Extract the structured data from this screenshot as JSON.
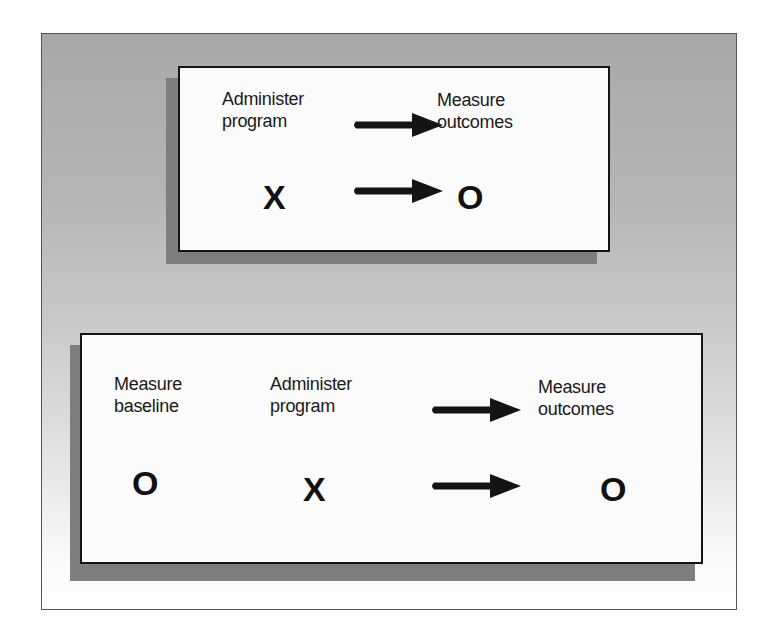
{
  "diagram": {
    "type": "research-design-notation",
    "legend": {
      "X": "Administer program",
      "O": "Measure (observation)"
    },
    "top_design": {
      "labels": {
        "administer": "Administer\nprogram",
        "measure_outcomes": "Measure\noutcomes"
      },
      "symbols": {
        "treatment": "X",
        "outcome": "O"
      },
      "arrows": [
        "label-arrow",
        "symbol-arrow"
      ]
    },
    "bottom_design": {
      "labels": {
        "measure_baseline": "Measure\nbaseline",
        "administer": "Administer\nprogram",
        "measure_outcomes": "Measure\noutcomes"
      },
      "symbols": {
        "baseline": "O",
        "treatment": "X",
        "outcome": "O"
      },
      "arrows": [
        "label-arrow",
        "symbol-arrow"
      ]
    },
    "colors": {
      "frame_top": "#a9a9a9",
      "frame_bottom": "#ffffff",
      "box_fill": "#fbfbfb",
      "box_border": "#141414",
      "shadow": "#7e7e7e",
      "ink": "#1a1a1a"
    }
  }
}
